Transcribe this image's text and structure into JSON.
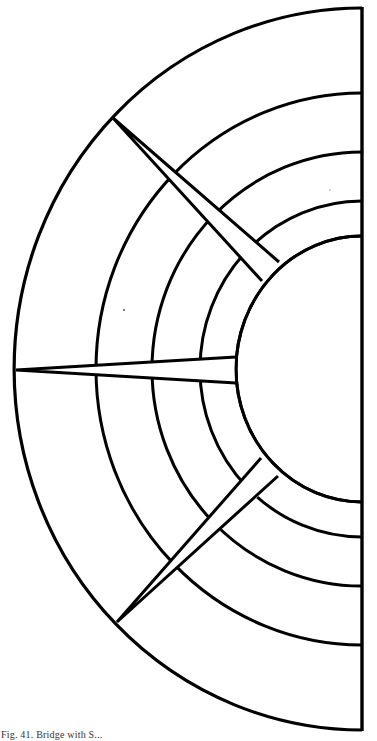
{
  "figure": {
    "stroke_color": "#000000",
    "background": "#ffffff",
    "center": {
      "x": 362,
      "y": 369
    },
    "outer_boundary": {
      "rx": 348,
      "ry": 361
    },
    "rings": [
      {
        "name": "ring-1",
        "rx": 266,
        "ry": 276
      },
      {
        "name": "ring-2",
        "rx": 210,
        "ry": 217
      },
      {
        "name": "ring-3",
        "rx": 162,
        "ry": 168
      },
      {
        "name": "inner-circle",
        "rx": 126,
        "ry": 133
      }
    ],
    "spokes": [
      {
        "name": "upper-spoke",
        "outer_tip": [
          113,
          118
        ],
        "inner_ends": [
          [
            262,
            281
          ],
          [
            279,
            262
          ]
        ]
      },
      {
        "name": "middle-spoke",
        "outer_tip": [
          16,
          370
        ],
        "inner_ends": [
          [
            236,
            357
          ],
          [
            236,
            383
          ]
        ]
      },
      {
        "name": "lower-spoke",
        "outer_tip": [
          117,
          622
        ],
        "inner_ends": [
          [
            278,
            476
          ],
          [
            261,
            458
          ]
        ]
      }
    ]
  },
  "caption": {
    "text": "Fig. 41.  Bridge with S..."
  }
}
